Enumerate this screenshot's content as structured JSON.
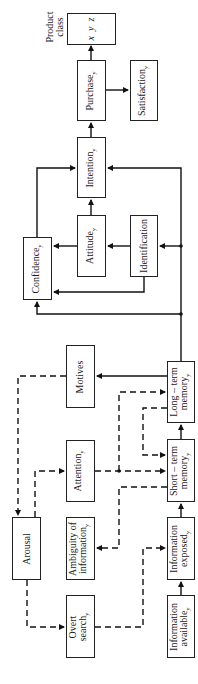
{
  "diagram": {
    "orientation": "rotated-90-ccw",
    "product_class": {
      "label_line1": "Product",
      "label_line2": "class",
      "items": [
        "x",
        "y",
        "z"
      ]
    },
    "nodes": [
      {
        "id": "purchase",
        "label": "Purchase",
        "sub": "y"
      },
      {
        "id": "satisfaction",
        "label": "Satisfaction",
        "sub": "y"
      },
      {
        "id": "intention",
        "label": "Intention",
        "sub": "y"
      },
      {
        "id": "attitude",
        "label": "Attitude",
        "sub": "y"
      },
      {
        "id": "identification",
        "label": "Identification",
        "sub": ""
      },
      {
        "id": "confidence",
        "label": "Confidence",
        "sub": "y"
      },
      {
        "id": "motives",
        "label": "Motives",
        "sub": ""
      },
      {
        "id": "long_term_memory",
        "label_line1": "Long – term",
        "label_line2": "memory",
        "sub": "y"
      },
      {
        "id": "attention",
        "label": "Attention",
        "sub": "y"
      },
      {
        "id": "short_term_memory",
        "label_line1": "Short – term",
        "label_line2": "memory",
        "sub": "y"
      },
      {
        "id": "arousal",
        "label": "Arousal",
        "sub": ""
      },
      {
        "id": "ambiguity",
        "label_line1": "Ambiguity of",
        "label_line2": "information",
        "sub": "y"
      },
      {
        "id": "information_exposed",
        "label_line1": "Information",
        "label_line2": "exposed",
        "sub": "y"
      },
      {
        "id": "overt_search",
        "label_line1": "Overt",
        "label_line2": "search",
        "sub": "y"
      },
      {
        "id": "information_available",
        "label_line1": "Information",
        "label_line2": "available",
        "sub": "y"
      }
    ],
    "edges": [
      {
        "from": "information_available",
        "to": "information_exposed",
        "style": "solid"
      },
      {
        "from": "information_exposed",
        "to": "short_term_memory",
        "style": "solid"
      },
      {
        "from": "short_term_memory",
        "to": "long_term_memory",
        "style": "solid"
      },
      {
        "from": "long_term_memory",
        "to": "motives",
        "style": "solid"
      },
      {
        "from": "long_term_memory",
        "to": "identification",
        "style": "solid"
      },
      {
        "from": "long_term_memory",
        "to": "intention",
        "style": "solid"
      },
      {
        "from": "long_term_memory",
        "to": "confidence",
        "style": "solid"
      },
      {
        "from": "identification",
        "to": "attitude",
        "style": "solid"
      },
      {
        "from": "identification",
        "to": "confidence",
        "style": "solid"
      },
      {
        "from": "attitude",
        "to": "confidence",
        "style": "solid"
      },
      {
        "from": "attitude",
        "to": "intention",
        "style": "solid"
      },
      {
        "from": "confidence",
        "to": "intention",
        "style": "solid"
      },
      {
        "from": "intention",
        "to": "purchase",
        "style": "solid"
      },
      {
        "from": "purchase",
        "to": "satisfaction",
        "style": "solid"
      },
      {
        "from": "purchase",
        "to": "product_class",
        "style": "solid"
      },
      {
        "from": "motives",
        "to": "arousal",
        "style": "dashed"
      },
      {
        "from": "arousal",
        "to": "attention",
        "style": "dashed"
      },
      {
        "from": "arousal",
        "to": "overt_search",
        "style": "dashed"
      },
      {
        "from": "attention",
        "to": "short_term_memory",
        "style": "dashed"
      },
      {
        "from": "attention",
        "to": "long_term_memory",
        "style": "dashed"
      },
      {
        "from": "long_term_memory",
        "to": "short_term_memory",
        "style": "dashed"
      },
      {
        "from": "short_term_memory",
        "to": "ambiguity",
        "style": "dashed"
      },
      {
        "from": "overt_search",
        "to": "information_exposed",
        "style": "dashed"
      }
    ]
  }
}
